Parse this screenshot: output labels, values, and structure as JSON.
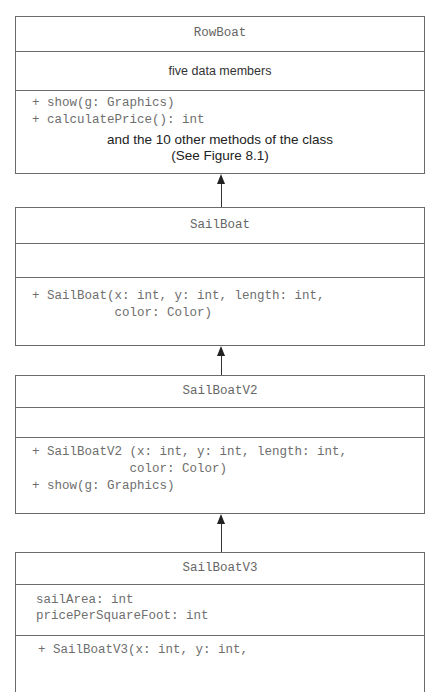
{
  "diagram": {
    "type": "UML class inheritance",
    "classes": [
      {
        "name": "RowBoat",
        "attributes_note": "five data members",
        "methods": [
          "+ show(g: Graphics)",
          "+ calculatePrice(): int"
        ],
        "methods_note": [
          "and the 10 other methods of the class",
          "(See Figure 8.1)"
        ]
      },
      {
        "name": "SailBoat",
        "attributes": [],
        "methods": [
          "+ SailBoat(x: int, y: int, length: int,",
          "           color: Color)"
        ]
      },
      {
        "name": "SailBoatV2",
        "attributes": [],
        "methods": [
          "+ SailBoatV2 (x: int, y: int, length: int,",
          "             color: Color)",
          "+ show(g: Graphics)"
        ]
      },
      {
        "name": "SailBoatV3",
        "attributes": [
          "sailArea: int",
          "pricePerSquareFoot: int"
        ],
        "methods": [
          "+ SailBoatV3(x: int, y: int,"
        ]
      }
    ],
    "relationships": [
      {
        "from": "SailBoat",
        "to": "RowBoat",
        "kind": "inheritance"
      },
      {
        "from": "SailBoatV2",
        "to": "SailBoat",
        "kind": "inheritance"
      },
      {
        "from": "SailBoatV3",
        "to": "SailBoatV2",
        "kind": "inheritance"
      }
    ]
  },
  "colors": {
    "line": "#6a6a6a",
    "code_text": "#6e6e6e",
    "note_text": "#222222",
    "arrow": "#222222"
  }
}
